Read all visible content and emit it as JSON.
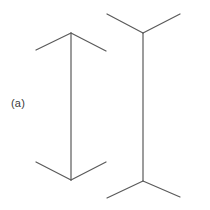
{
  "figure": {
    "label": "(a)",
    "background_color": "#ffffff",
    "stroke_color": "#5a5a5a",
    "stroke_width": 1.2,
    "width": 210,
    "height": 210
  },
  "chart_data": {
    "type": "diagram",
    "title": "",
    "subtitle": "",
    "xlabel": "",
    "ylabel": "",
    "annotations": [
      "(a)"
    ],
    "legend": [],
    "grid": false,
    "axis_ranges": {
      "x": [
        0,
        210
      ],
      "y": [
        0,
        210
      ]
    },
    "shapes": [
      {
        "name": "left-figure-shaft",
        "type": "line",
        "x1": 71,
        "y1": 33,
        "x2": 71,
        "y2": 180
      },
      {
        "name": "left-figure-top-left-fin",
        "type": "line",
        "x1": 71,
        "y1": 33,
        "x2": 36,
        "y2": 50
      },
      {
        "name": "left-figure-top-right-fin",
        "type": "line",
        "x1": 71,
        "y1": 33,
        "x2": 106,
        "y2": 51
      },
      {
        "name": "left-figure-bottom-left-fin",
        "type": "line",
        "x1": 71,
        "y1": 180,
        "x2": 36,
        "y2": 162
      },
      {
        "name": "left-figure-bottom-right-fin",
        "type": "line",
        "x1": 71,
        "y1": 180,
        "x2": 106,
        "y2": 162
      },
      {
        "name": "right-figure-shaft",
        "type": "line",
        "x1": 143,
        "y1": 33,
        "x2": 143,
        "y2": 181
      },
      {
        "name": "right-figure-top-left-fin",
        "type": "line",
        "x1": 143,
        "y1": 33,
        "x2": 107,
        "y2": 14
      },
      {
        "name": "right-figure-top-right-fin",
        "type": "line",
        "x1": 143,
        "y1": 33,
        "x2": 180,
        "y2": 14
      },
      {
        "name": "right-figure-bottom-left-fin",
        "type": "line",
        "x1": 143,
        "y1": 181,
        "x2": 107,
        "y2": 198
      },
      {
        "name": "right-figure-bottom-right-fin",
        "type": "line",
        "x1": 143,
        "y1": 181,
        "x2": 180,
        "y2": 197
      }
    ]
  }
}
